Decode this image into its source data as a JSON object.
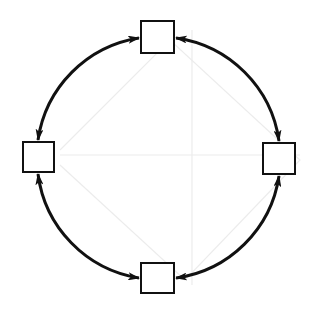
{
  "diagram": {
    "type": "cycle",
    "center": [
      158,
      158
    ],
    "radius": 121,
    "stroke_color": "#111111",
    "background_color": "#ffffff",
    "ghost_line_color": "#ececec",
    "nodes": [
      {
        "id": "top",
        "label": "",
        "x": 140,
        "y": 20,
        "w": 35,
        "h": 34
      },
      {
        "id": "right",
        "label": "",
        "x": 262,
        "y": 142,
        "w": 34,
        "h": 33
      },
      {
        "id": "bottom",
        "label": "",
        "x": 140,
        "y": 262,
        "w": 35,
        "h": 32
      },
      {
        "id": "left",
        "label": "",
        "x": 22,
        "y": 141,
        "w": 33,
        "h": 32
      }
    ],
    "edges": [
      {
        "from": "top",
        "to": "right",
        "arrowheads": "both"
      },
      {
        "from": "right",
        "to": "bottom",
        "arrowheads": "both"
      },
      {
        "from": "bottom",
        "to": "left",
        "arrowheads": "both"
      },
      {
        "from": "left",
        "to": "top",
        "arrowheads": "both"
      }
    ]
  }
}
